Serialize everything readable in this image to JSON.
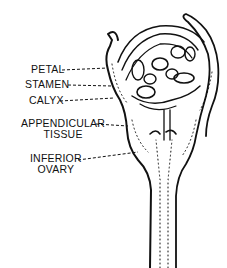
{
  "diagram": {
    "labels": [
      {
        "id": "petal",
        "lines": [
          "PETAL"
        ]
      },
      {
        "id": "stamen",
        "lines": [
          "STAMEN"
        ]
      },
      {
        "id": "calyx",
        "lines": [
          "CALYX"
        ]
      },
      {
        "id": "appendicular-tissue",
        "lines": [
          "APPENDICULAR",
          "TISSUE"
        ]
      },
      {
        "id": "inferior-ovary",
        "lines": [
          "INFERIOR",
          "OVARY"
        ]
      }
    ]
  }
}
